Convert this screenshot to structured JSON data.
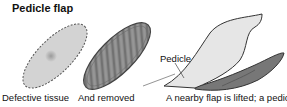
{
  "title": "Pedicle flap",
  "panels": [
    {
      "caption": "Defective tissue"
    },
    {
      "caption": "And removed"
    },
    {
      "caption": "A  nearby flap is lifted; a pedicle",
      "label": "Pedicle"
    }
  ]
}
